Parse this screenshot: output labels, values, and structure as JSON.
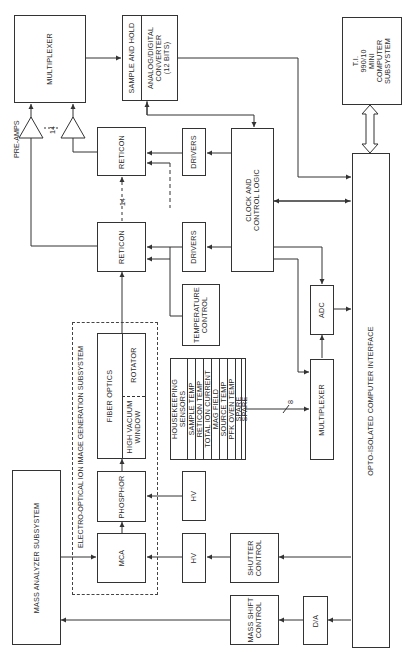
{
  "diagram": {
    "blocks": {
      "multiplexer_top": {
        "label": "MULTIPLEXER"
      },
      "sample_hold": {
        "label": "SAMPLE AND HOLD"
      },
      "adc_12bit": {
        "line1": "ANALOG/DIGITAL",
        "line2": "CONVERTER",
        "line3": "(12 BITS)"
      },
      "ti_computer": {
        "line1": "T.I.",
        "line2": "990/10",
        "line3": "MINI",
        "line4": "COMPUTER",
        "line5": "SUBSYSTEM"
      },
      "reticon_1": {
        "label": "RETICON"
      },
      "reticon_2": {
        "label": "RETICON"
      },
      "drivers_1": {
        "label": "DRIVERS"
      },
      "drivers_2": {
        "label": "DRIVERS"
      },
      "clock_control": {
        "line1": "CLOCK AND",
        "line2": "CONTROL LOGIC"
      },
      "temperature_control": {
        "line1": "TEMPERATURE",
        "line2": "CONTROL"
      },
      "adc": {
        "label": "ADC"
      },
      "multiplexer_bottom": {
        "label": "MULTIPLEXER"
      },
      "opto_interface": {
        "label": "OPTO-ISOLATED COMPUTER INTERFACE"
      },
      "fiber_optics": {
        "label": "FIBER OPTICS"
      },
      "rotator": {
        "label": "ROTATOR"
      },
      "high_vacuum_window": {
        "line1": "HIGH VACUUM",
        "line2": "WINDOW"
      },
      "phosphor": {
        "label": "PHOSPHOR"
      },
      "mca": {
        "label": "MCA"
      },
      "hv_1": {
        "label": "HV"
      },
      "hv_2": {
        "label": "HV"
      },
      "shutter_control": {
        "line1": "SHUTTER",
        "line2": "CONTROL"
      },
      "mass_shift_control": {
        "line1": "MASS SHIFT",
        "line2": "CONTROL"
      },
      "d_a": {
        "label": "D/A"
      },
      "mass_analyzer": {
        "label": "MASS ANALYZER SUBSYSTEM"
      }
    },
    "subsystem_label": "ELECTRO-OPTICAL ION IMAGE GENERATION SUBSYSTEM",
    "housekeeping": {
      "header_line1": "HOUSEKEEPING",
      "header_line2": "SENSORS",
      "items": [
        "SAMPLE TEMP",
        "RETICON TEMP",
        "TOTAL ION CURRENT",
        "MAG FIELD",
        "SOURCE TEMP",
        "PFK OVEN TEMP",
        "SPARE",
        "SPARE"
      ]
    },
    "annotations": {
      "pre_amps": "PRE-AMPS",
      "channel_count_preamps": "14",
      "channel_count_reticon": "14",
      "bus_width_housekeeping": "8"
    }
  }
}
